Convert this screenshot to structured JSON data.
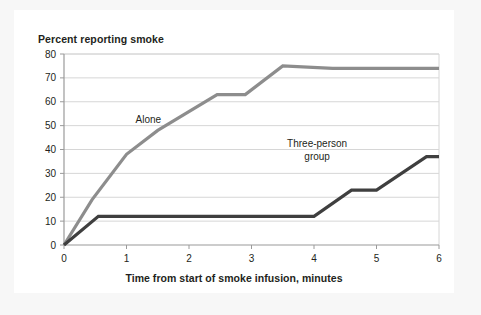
{
  "figure": {
    "background_color": "#f7f7f7",
    "card_color": "#ffffff"
  },
  "chart_data": {
    "type": "line",
    "title": "Percent reporting smoke",
    "xlabel": "Time from start of smoke infusion, minutes",
    "ylabel": "",
    "xlim": [
      0,
      6
    ],
    "ylim": [
      0,
      80
    ],
    "xticks": [
      "0",
      "1",
      "2",
      "3",
      "4",
      "5",
      "6"
    ],
    "yticks": [
      "0",
      "10",
      "20",
      "30",
      "40",
      "50",
      "60",
      "70",
      "80"
    ],
    "grid": "horizontal",
    "legend_position": "inline-annotation",
    "series": [
      {
        "name": "Alone",
        "color": "#8d8d8d",
        "label_x": 1.35,
        "label_y": 51,
        "points": [
          {
            "x": 0.0,
            "y": 0
          },
          {
            "x": 0.45,
            "y": 19
          },
          {
            "x": 1.0,
            "y": 38
          },
          {
            "x": 1.5,
            "y": 48
          },
          {
            "x": 2.45,
            "y": 63
          },
          {
            "x": 2.9,
            "y": 63
          },
          {
            "x": 3.5,
            "y": 75
          },
          {
            "x": 4.3,
            "y": 74
          },
          {
            "x": 6.0,
            "y": 74
          }
        ]
      },
      {
        "name": "Three-person group",
        "color": "#3f3f3f",
        "label_line1": "Three-person",
        "label_line2": "group",
        "label_x": 4.05,
        "label_y": 41,
        "points": [
          {
            "x": 0.0,
            "y": 0
          },
          {
            "x": 0.55,
            "y": 12
          },
          {
            "x": 4.0,
            "y": 12
          },
          {
            "x": 4.6,
            "y": 23
          },
          {
            "x": 5.0,
            "y": 23
          },
          {
            "x": 5.8,
            "y": 37
          },
          {
            "x": 6.0,
            "y": 37
          }
        ]
      }
    ]
  }
}
